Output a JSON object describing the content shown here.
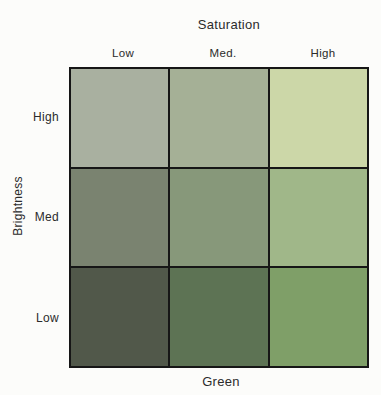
{
  "figure": {
    "top_axis_title": "Saturation",
    "left_axis_title": "Brightness",
    "bottom_axis_title": "Green",
    "column_labels": [
      "Low",
      "Med.",
      "High"
    ],
    "row_labels": [
      "High",
      "Med",
      "Low"
    ]
  },
  "colors": {
    "background": "#fcfcfa",
    "grid_line": "#161616",
    "text": "#2b2b2b"
  },
  "chart_data": {
    "type": "heatmap",
    "title": "Saturation",
    "xlabel": "Saturation",
    "ylabel": "Brightness",
    "bottom_label": "Green",
    "hue": "green",
    "x_categories": [
      "Low",
      "Med.",
      "High"
    ],
    "y_categories": [
      "High",
      "Med",
      "Low"
    ],
    "grid": "on",
    "legend": "off",
    "cell_colors": [
      [
        "#a9b0a0",
        "#a5b096",
        "#ccd7a8"
      ],
      [
        "#7a8370",
        "#87987a",
        "#a0b789"
      ],
      [
        "#51584a",
        "#5d7354",
        "#7f9f68"
      ]
    ]
  }
}
